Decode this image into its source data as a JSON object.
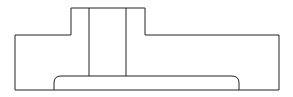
{
  "diagram": {
    "type": "technical-section-drawing",
    "stroke_color": "#222222",
    "background": "#ffffff",
    "shapes": {
      "outline": "M15,90 L15,35 L71,35 L71,8 L145,8 L145,35 L279,35 L279,90 Z",
      "bore_left": {
        "x1": 89,
        "y1": 8,
        "x2": 89,
        "y2": 76
      },
      "bore_right": {
        "x1": 126,
        "y1": 8,
        "x2": 126,
        "y2": 76
      },
      "slot": "M54,90 L54,83 Q54,76 61,76 L232,76 Q239,76 239,83 L239,90"
    }
  }
}
